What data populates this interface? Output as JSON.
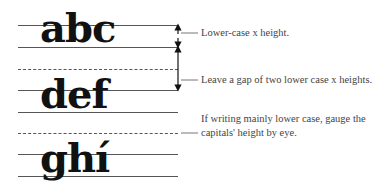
{
  "diagram": {
    "letter_rows": [
      {
        "text": "abc"
      },
      {
        "text": "def"
      },
      {
        "text": "ghí"
      }
    ],
    "annotations": [
      {
        "text": "Lower-case x height."
      },
      {
        "text": "Leave a gap of two lower case x heights."
      },
      {
        "text": "If writing mainly lower case, gauge the capitals' height by eye."
      }
    ],
    "colors": {
      "ink": "#111111",
      "lines": "#555555",
      "annotation_text": "#444444"
    }
  }
}
